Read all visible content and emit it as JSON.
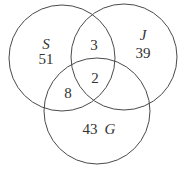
{
  "diagram": {
    "type": "venn",
    "sets": [
      {
        "name": "S",
        "only": "51"
      },
      {
        "name": "J",
        "only": "39"
      },
      {
        "name": "G",
        "only": "43"
      }
    ],
    "regions": {
      "S_J_only": "3",
      "S_G_only": "8",
      "S_J_G": "2"
    }
  }
}
